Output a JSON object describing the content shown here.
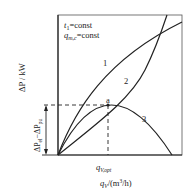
{
  "figure": {
    "conditions": [
      {
        "var": "t",
        "sub": "1",
        "text": "=const"
      },
      {
        "var": "q",
        "sub": "m,c",
        "text": "=const"
      }
    ],
    "y_axis_label": {
      "main": "ΔP / kW"
    },
    "x_axis_label": {
      "var": "q",
      "sub": "V",
      "unit": "/(m",
      "sup": "3",
      "unit_end": "/h)"
    },
    "x_marker_label": {
      "var": "q",
      "sub": "V,opt"
    },
    "bracket_label": {
      "a": "ΔP",
      "a_sub": "el",
      "dash": "−",
      "b": "ΔP",
      "b_sub": "pu"
    },
    "curves": [
      {
        "id": "1",
        "label": "1"
      },
      {
        "id": "2",
        "label": "2"
      },
      {
        "id": "3",
        "label": "3"
      }
    ],
    "point": {
      "label": "a"
    },
    "colors": {
      "line": "#222222",
      "background": "#ffffff"
    }
  }
}
